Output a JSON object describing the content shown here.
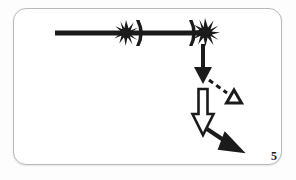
{
  "figure": {
    "label": "5",
    "caption_number": "5",
    "background_color": "#fdfdfd",
    "card_color": "#ffffff",
    "card_border_color": "#b9b9b9",
    "ink_color": "#1b1b1b"
  },
  "diagram": {
    "title": "",
    "elements": [
      {
        "name": "horizontal-beam",
        "type": "thick-line",
        "from": [
          55,
          33
        ],
        "to": [
          200,
          33
        ],
        "stroke_width": 5,
        "color": "#1b1b1b"
      },
      {
        "name": "starburst-left",
        "type": "starburst",
        "center": [
          126,
          33
        ],
        "radius": 11,
        "points": 11,
        "color": "#1b1b1b"
      },
      {
        "name": "bracket-left",
        "type": "crescent-bracket",
        "center": [
          139,
          33
        ],
        "height": 26,
        "color": "#1b1b1b"
      },
      {
        "name": "bracket-right",
        "type": "crescent-bracket",
        "center": [
          192,
          33
        ],
        "height": 26,
        "color": "#1b1b1b"
      },
      {
        "name": "starburst-right",
        "type": "starburst",
        "center": [
          205,
          32
        ],
        "radius": 12,
        "points": 11,
        "color": "#1b1b1b"
      },
      {
        "name": "solid-down-arrow",
        "type": "arrow-solid",
        "from": [
          203,
          44
        ],
        "to": [
          203,
          83
        ],
        "stroke_width": 4,
        "color": "#1b1b1b"
      },
      {
        "name": "dashed-arrow",
        "type": "arrow-dashed",
        "from": [
          208,
          80
        ],
        "to": [
          228,
          95
        ],
        "stroke_width": 3,
        "dash": "5 4",
        "color": "#1b1b1b"
      },
      {
        "name": "open-triangle-marker",
        "type": "triangle-outline",
        "center": [
          234,
          98
        ],
        "size": 13,
        "color": "#1b1b1b"
      },
      {
        "name": "hollow-down-arrow",
        "type": "arrow-hollow",
        "from": [
          203,
          88
        ],
        "to": [
          203,
          134
        ],
        "width": 16,
        "color": "#1b1b1b"
      },
      {
        "name": "solid-diagonal-arrow",
        "type": "arrow-solid",
        "from": [
          207,
          130
        ],
        "to": [
          238,
          150
        ],
        "stroke_width": 4,
        "color": "#1b1b1b"
      }
    ]
  }
}
